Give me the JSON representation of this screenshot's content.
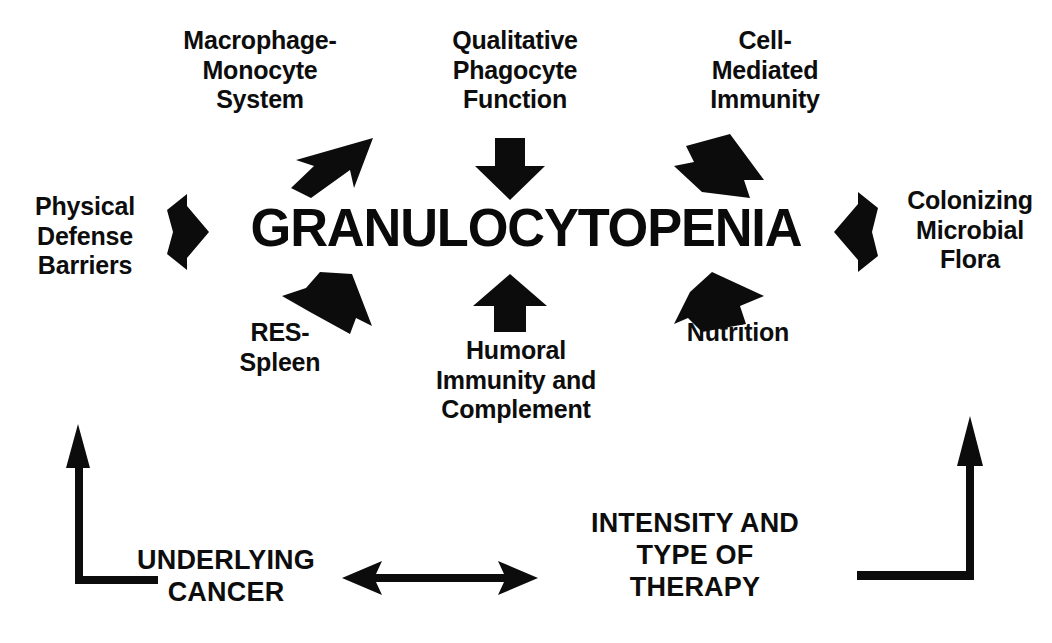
{
  "diagram": {
    "title": "GRANULOCYTOPENIA",
    "center_node": "GRANULOCYTOPENIA",
    "colors": {
      "ink": "#0a0a0a",
      "background": "#ffffff"
    },
    "top_labels": [
      {
        "id": "macrophage-monocyte-system",
        "text": "Macrophage-\nMonocyte\nSystem"
      },
      {
        "id": "qualitative-phagocyte-function",
        "text": "Qualitative\nPhagocyte\nFunction"
      },
      {
        "id": "cell-mediated-immunity",
        "text": "Cell-\nMediated\nImmunity"
      }
    ],
    "side_labels": [
      {
        "id": "physical-defense-barriers",
        "text": "Physical\nDefense\nBarriers"
      },
      {
        "id": "colonizing-microbial-flora",
        "text": "Colonizing\nMicrobial\nFlora"
      }
    ],
    "bottom_labels": [
      {
        "id": "res-spleen",
        "text": "RES-\nSpleen"
      },
      {
        "id": "humoral-immunity-and-complement",
        "text": "Humoral\nImmunity and\nComplement"
      },
      {
        "id": "nutrition",
        "text": "Nutrition"
      }
    ],
    "base_labels": [
      {
        "id": "underlying-cancer",
        "text": "UNDERLYING\nCANCER"
      },
      {
        "id": "intensity-and-type-of-therapy",
        "text": "INTENSITY AND\nTYPE OF\nTHERAPY"
      }
    ],
    "arrows": [
      {
        "id": "arrow-macrophage-to-center",
        "direction": "down-left",
        "from": "Macrophage-Monocyte System",
        "to": "GRANULOCYTOPENIA"
      },
      {
        "id": "arrow-qualitative-to-center",
        "direction": "down",
        "from": "Qualitative Phagocyte Function",
        "to": "GRANULOCYTOPENIA"
      },
      {
        "id": "arrow-cellmediated-to-center",
        "direction": "down-left",
        "from": "Cell-Mediated Immunity",
        "to": "GRANULOCYTOPENIA"
      },
      {
        "id": "arrow-physical-to-center",
        "direction": "right",
        "from": "Physical Defense Barriers",
        "to": "GRANULOCYTOPENIA"
      },
      {
        "id": "arrow-colonizing-to-center",
        "direction": "left",
        "from": "Colonizing Microbial Flora",
        "to": "GRANULOCYTOPENIA"
      },
      {
        "id": "arrow-res-to-center",
        "direction": "up-right",
        "from": "RES-Spleen",
        "to": "GRANULOCYTOPENIA"
      },
      {
        "id": "arrow-humoral-to-center",
        "direction": "up",
        "from": "Humoral Immunity and Complement",
        "to": "GRANULOCYTOPENIA"
      },
      {
        "id": "arrow-nutrition-to-center",
        "direction": "up-left",
        "from": "Nutrition",
        "to": "GRANULOCYTOPENIA"
      },
      {
        "id": "arrow-underlying-cancer-up",
        "direction": "elbow-up-left",
        "from": "UNDERLYING CANCER",
        "to": "host defense network"
      },
      {
        "id": "arrow-therapy-up",
        "direction": "elbow-up-right",
        "from": "INTENSITY AND TYPE OF THERAPY",
        "to": "host defense network"
      },
      {
        "id": "arrow-cancer-therapy-bidirectional",
        "direction": "bidirectional-horizontal",
        "from": "UNDERLYING CANCER",
        "to": "INTENSITY AND TYPE OF THERAPY"
      }
    ]
  }
}
